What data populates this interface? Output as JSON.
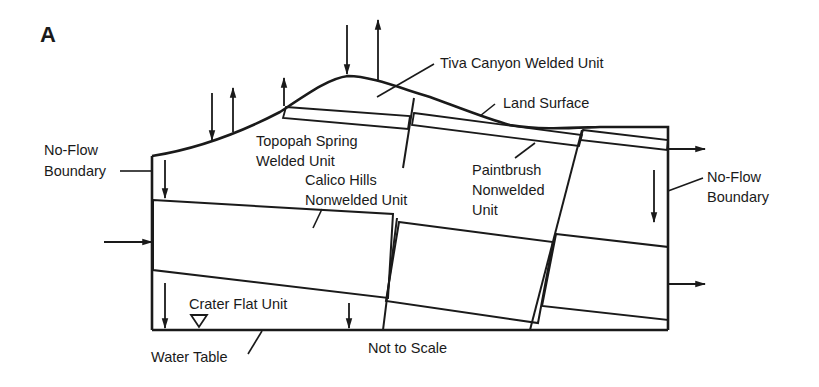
{
  "figure": {
    "panel_label": "A",
    "scale_note": "Not to Scale"
  },
  "labels": {
    "tiva_canyon": "Tiva Canyon Welded Unit",
    "land_surface": "Land Surface",
    "no_flow_left_1": "No-Flow",
    "no_flow_left_2": "Boundary",
    "topopah_1": "Topopah Spring",
    "topopah_2": "Welded Unit",
    "calico_1": "Calico Hills",
    "calico_2": "Nonwelded Unit",
    "paintbrush_1": "Paintbrush",
    "paintbrush_2": "Nonwelded",
    "paintbrush_3": "Unit",
    "no_flow_right_1": "No-Flow",
    "no_flow_right_2": "Boundary",
    "crater_flat": "Crater Flat Unit",
    "water_table": "Water Table"
  },
  "units": [
    {
      "name": "Tiva Canyon Welded Unit",
      "pattern": "blank"
    },
    {
      "name": "Paintbrush Nonwelded Unit",
      "pattern": "thin-stippled-band"
    },
    {
      "name": "Topopah Spring Welded Unit",
      "pattern": "blank"
    },
    {
      "name": "Calico Hills Nonwelded Unit",
      "pattern": "stippled"
    },
    {
      "name": "Crater Flat Unit",
      "pattern": "blank"
    }
  ],
  "colors": {
    "ink": "#1a1a1a",
    "background": "#ffffff"
  }
}
